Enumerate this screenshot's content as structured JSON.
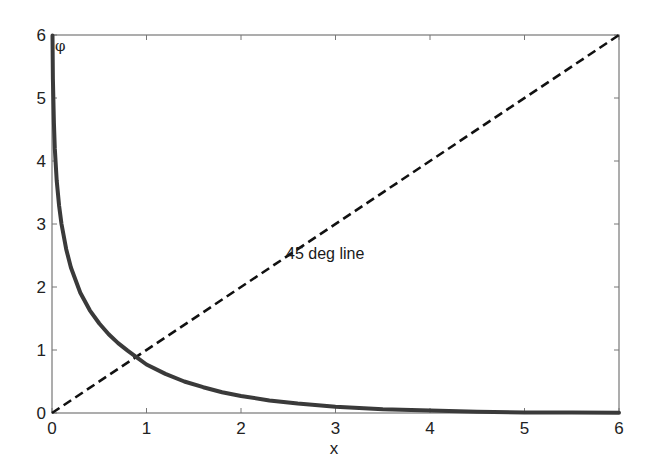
{
  "chart_data": {
    "type": "line",
    "title": "",
    "xlabel": "x",
    "ylabel": "φ",
    "xlim": [
      0,
      6
    ],
    "ylim": [
      0,
      6
    ],
    "grid": false,
    "x_ticks": [
      0,
      1,
      2,
      3,
      4,
      5,
      6
    ],
    "y_ticks": [
      0,
      1,
      2,
      3,
      4,
      5,
      6
    ],
    "series": [
      {
        "name": "phi(x) = -ln(tanh(x/2))",
        "style": "solid",
        "color": "#3a3a3a",
        "x": [
          0.005,
          0.01,
          0.02,
          0.03,
          0.05,
          0.075,
          0.1,
          0.15,
          0.2,
          0.3,
          0.4,
          0.5,
          0.6,
          0.7,
          0.8,
          0.9,
          1.0,
          1.2,
          1.4,
          1.6,
          1.8,
          2.0,
          2.3,
          2.6,
          3.0,
          3.5,
          4.0,
          4.5,
          5.0,
          5.5,
          6.0
        ],
        "values": [
          5.99,
          5.3,
          4.61,
          4.2,
          3.69,
          3.29,
          3.0,
          2.6,
          2.31,
          1.91,
          1.63,
          1.42,
          1.25,
          1.11,
          0.99,
          0.88,
          0.77,
          0.62,
          0.5,
          0.41,
          0.33,
          0.27,
          0.2,
          0.15,
          0.1,
          0.06,
          0.04,
          0.02,
          0.01,
          0.01,
          0.005
        ]
      },
      {
        "name": "45 deg line",
        "style": "dashed",
        "color": "#111111",
        "x": [
          0,
          6
        ],
        "values": [
          0,
          6
        ]
      }
    ],
    "annotations": [
      {
        "text": "45 deg line",
        "x": 2.45,
        "y": 2.55
      },
      {
        "text": "φ",
        "x": 0.05,
        "y": 5.8
      }
    ]
  },
  "labels": {
    "x_axis": "x",
    "y_axis_symbol": "φ",
    "line_annotation": "45 deg line",
    "x_tick_labels": [
      "0",
      "1",
      "2",
      "3",
      "4",
      "5",
      "6"
    ],
    "y_tick_labels": [
      "0",
      "1",
      "2",
      "3",
      "4",
      "5",
      "6"
    ]
  }
}
